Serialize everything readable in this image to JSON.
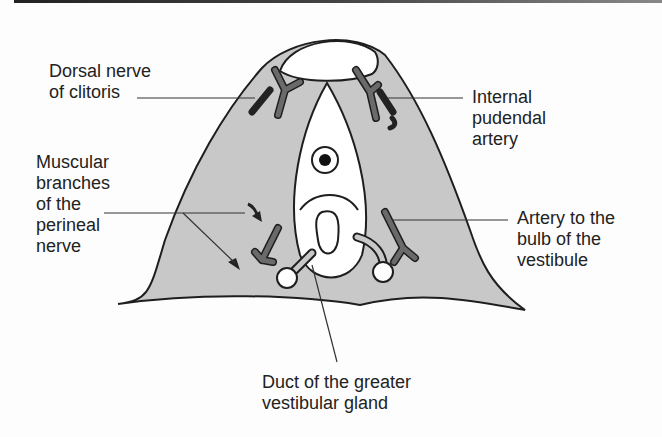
{
  "figure": {
    "type": "anatomical-diagram",
    "colors": {
      "tissue": "#c8c8c8",
      "outline": "#1e1e1e",
      "artery": "#6a6a6a",
      "nerve": "#222222",
      "opening": "#ffffff"
    }
  },
  "labels": {
    "dorsal_nerve": "Dorsal nerve\nof clitoris",
    "internal_pudendal": "Internal\npudendal\nartery",
    "muscular_branches": "Muscular\nbranches\nof the\nperineal\nnerve",
    "artery_bulb": "Artery to the\nbulb of the\nvestibule",
    "duct_gland": "Duct of the greater\nvestibular gland"
  }
}
